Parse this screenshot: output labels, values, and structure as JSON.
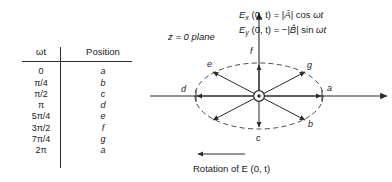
{
  "figure": {
    "colors": {
      "ink": "#2b2b2b",
      "background": "#ffffff"
    }
  },
  "table": {
    "headers": [
      "ωt",
      "Position"
    ],
    "rows": [
      {
        "omega_t": "0",
        "position": "a"
      },
      {
        "omega_t": "π/4",
        "position": "b"
      },
      {
        "omega_t": "π/2",
        "position": "c"
      },
      {
        "omega_t": "π",
        "position": "d"
      },
      {
        "omega_t": "5π/4",
        "position": "e"
      },
      {
        "omega_t": "3π/2",
        "position": "f"
      },
      {
        "omega_t": "7π/4",
        "position": "g"
      },
      {
        "omega_t": "2π",
        "position": "a"
      }
    ]
  },
  "diagram": {
    "plane_label": "z = 0 plane",
    "rotation_label": "Rotation of E (0, t)",
    "equations": [
      "Ex (0, t) = |Â| cos ωt",
      "Ey (0, t) = −|B̂| sin ωt"
    ],
    "equation_parts": {
      "eq1": {
        "field": "E",
        "sub": "x",
        "args": " (0, t) = |",
        "amp": "Â",
        "tail": "| cos ",
        "omega": "ωt"
      },
      "eq2": {
        "field": "E",
        "sub": "y",
        "args": " (0, t) = −|",
        "amp": "B̂",
        "tail": "| sin ",
        "omega": "ωt"
      }
    },
    "vector_labels": [
      {
        "id": "a",
        "label": "a"
      },
      {
        "id": "b",
        "label": "b"
      },
      {
        "id": "c",
        "label": "c"
      },
      {
        "id": "d",
        "label": "d"
      },
      {
        "id": "e",
        "label": "e"
      },
      {
        "id": "f",
        "label": "f"
      },
      {
        "id": "g",
        "label": "g"
      }
    ],
    "center_symbol": "out-of-page-vector"
  }
}
